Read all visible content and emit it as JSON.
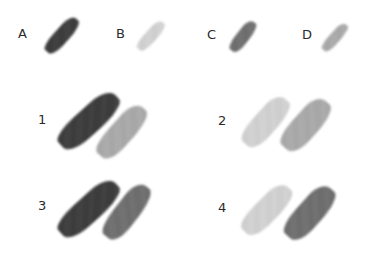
{
  "swatches": [
    {
      "label": "A",
      "color": "#3a3a3a"
    },
    {
      "label": "B",
      "color": "#d4d4d4"
    },
    {
      "label": "C",
      "color": "#6e6e6e"
    },
    {
      "label": "D",
      "color": "#ababab"
    }
  ],
  "pairs": [
    {
      "label": "1",
      "left_color": "#3a3a3a",
      "right_color": "#ababab"
    },
    {
      "label": "2",
      "left_color": "#d4d4d4",
      "right_color": "#ababab"
    },
    {
      "label": "3",
      "left_color": "#3a3a3a",
      "right_color": "#6e6e6e"
    },
    {
      "label": "4",
      "left_color": "#d4d4d4",
      "right_color": "#6e6e6e"
    }
  ]
}
